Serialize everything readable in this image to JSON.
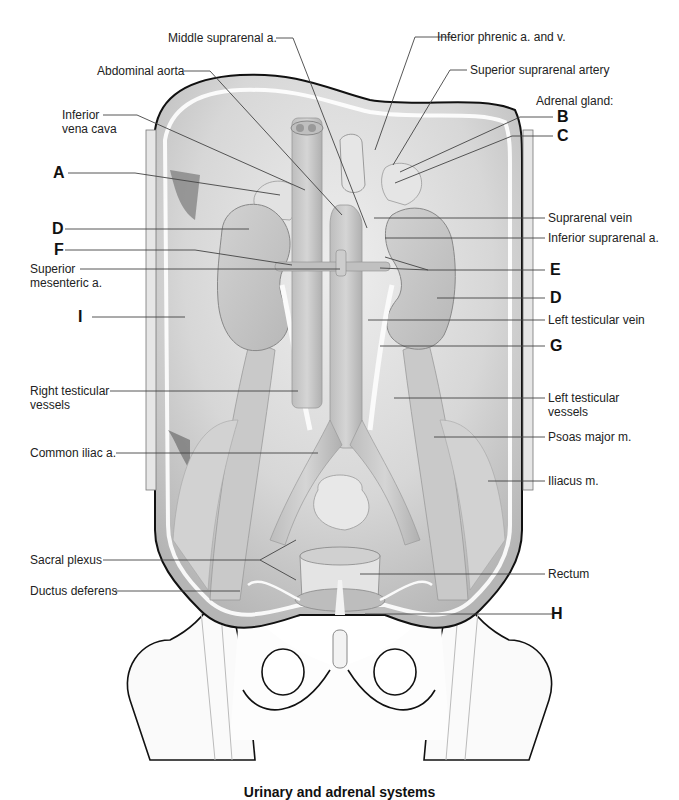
{
  "figure": {
    "caption": "Urinary and adrenal systems"
  },
  "labels": {
    "middle_suprarenal_a": "Middle suprarenal a.",
    "abdominal_aorta": "Abdominal aorta",
    "inferior_vena_cava_1": "Inferior",
    "inferior_vena_cava_2": "vena cava",
    "inferior_phrenic": "Inferior phrenic a. and v.",
    "superior_suprarenal_artery": "Superior suprarenal artery",
    "adrenal_gland": "Adrenal gland:",
    "superior_mesenteric_1": "Superior",
    "superior_mesenteric_2": "mesenteric a.",
    "suprarenal_vein": "Suprarenal vein",
    "inferior_suprarenal_a": "Inferior suprarenal a.",
    "left_testicular_vein": "Left testicular vein",
    "right_testicular_vessels_1": "Right testicular",
    "right_testicular_vessels_2": "vessels",
    "left_testicular_vessels_1": "Left testicular",
    "left_testicular_vessels_2": "vessels",
    "psoas_major": "Psoas major m.",
    "common_iliac": "Common iliac a.",
    "iliacus": "Iliacus m.",
    "sacral_plexus": "Sacral plexus",
    "rectum": "Rectum",
    "ductus_deferens": "Ductus deferens"
  },
  "letters": {
    "A": "A",
    "B": "B",
    "C": "C",
    "D_left": "D",
    "D_right": "D",
    "E": "E",
    "F": "F",
    "G": "G",
    "H": "H",
    "I": "I"
  },
  "colors": {
    "tissue": "#d9d9d9",
    "tissue_dark": "#a9a9a9",
    "organ": "#c8c8c8",
    "outline": "#111111",
    "leader": "#444444",
    "bone": "#ffffff"
  }
}
